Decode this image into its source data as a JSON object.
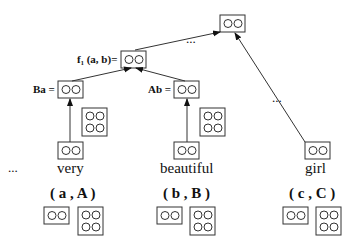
{
  "labels": {
    "f1": "f₁ (a, b)=",
    "ba": "Ba =",
    "ab": "Ab ="
  },
  "words": [
    "very",
    "beautiful",
    "girl"
  ],
  "pairs": [
    "( a , A )",
    "( b , B )",
    "( c , C )"
  ],
  "ellipsis": [
    "...",
    "...",
    "..."
  ],
  "colors": {
    "line": "#333333"
  }
}
